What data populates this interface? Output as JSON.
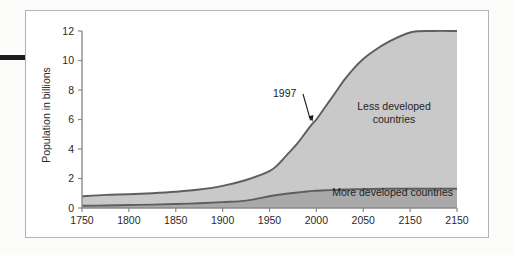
{
  "figure": {
    "background_color": "#fbfbfa",
    "frame_color": "#b3b3b3",
    "margin_mark_color": "#1c1c1c"
  },
  "chart_data": {
    "type": "area",
    "stacked": true,
    "title": "",
    "xlabel": "",
    "ylabel": "Population in billions",
    "xlim": [
      1750,
      2150
    ],
    "ylim": [
      0,
      12
    ],
    "grid": false,
    "legend_position": "inside-annotations",
    "xticks": [
      1750,
      1800,
      1850,
      1900,
      1950,
      2000,
      2050,
      2150,
      2150
    ],
    "xtick_labels": [
      "1750",
      "1800",
      "1850",
      "1900",
      "1950",
      "2000",
      "2050",
      "2150",
      "2150"
    ],
    "yticks": [
      0,
      2,
      4,
      6,
      8,
      10,
      12
    ],
    "ytick_labels": [
      "0",
      "2",
      "4",
      "6",
      "8",
      "10",
      "12"
    ],
    "x": [
      1750,
      1775,
      1800,
      1825,
      1850,
      1875,
      1900,
      1925,
      1950,
      1960,
      1970,
      1980,
      1990,
      1997,
      2000,
      2010,
      2020,
      2030,
      2040,
      2050,
      2060,
      2075,
      2100,
      2125,
      2150
    ],
    "series": [
      {
        "name": "More developed countries",
        "color": "#a9a9a9",
        "edge_color": "#5e5e5e",
        "label": "More developed countries",
        "values": [
          0.15,
          0.17,
          0.2,
          0.23,
          0.27,
          0.32,
          0.4,
          0.5,
          0.8,
          0.9,
          0.98,
          1.05,
          1.12,
          1.16,
          1.17,
          1.2,
          1.22,
          1.25,
          1.27,
          1.28,
          1.29,
          1.3,
          1.3,
          1.3,
          1.3
        ]
      },
      {
        "name": "Less developed countries",
        "color": "#c9c9c9",
        "edge_color": "#5e5e5e",
        "label_line1": "Less developed",
        "label_line2": "countries",
        "values": [
          0.64,
          0.72,
          0.73,
          0.77,
          0.83,
          0.93,
          1.1,
          1.4,
          1.7,
          2.1,
          2.72,
          3.35,
          4.13,
          4.64,
          4.83,
          5.7,
          6.58,
          7.45,
          8.2,
          8.82,
          9.3,
          9.9,
          10.6,
          11.2,
          11.6
        ]
      }
    ],
    "total_values": [
      0.79,
      0.89,
      0.93,
      1.0,
      1.1,
      1.25,
      1.5,
      1.9,
      2.5,
      3.0,
      3.7,
      4.4,
      5.25,
      5.8,
      6.0,
      6.9,
      7.8,
      8.7,
      9.47,
      10.1,
      10.59,
      11.2,
      11.9,
      12.5,
      12.9
    ],
    "annotations": [
      {
        "name": "year-1997",
        "text": "1997",
        "x": 1997,
        "y": 5.8,
        "note": "leader line with arrow pointing to upper curve at 1997"
      }
    ]
  }
}
